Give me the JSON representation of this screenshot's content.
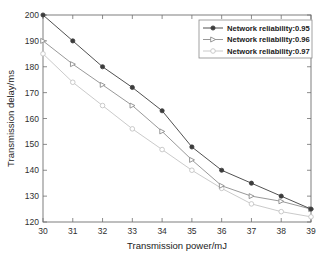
{
  "chart_data": {
    "type": "line",
    "title": "",
    "xlabel": "Transmission power/mJ",
    "ylabel": "Transmission delay/ms",
    "x": [
      30,
      31,
      32,
      33,
      34,
      35,
      36,
      37,
      38,
      39
    ],
    "xtick_labels": [
      "30",
      "31",
      "32",
      "33",
      "34",
      "35",
      "36",
      "37",
      "38",
      "39"
    ],
    "ytick_labels": [
      "120",
      "130",
      "140",
      "150",
      "160",
      "170",
      "180",
      "190",
      "200"
    ],
    "yticks": [
      120,
      130,
      140,
      150,
      160,
      170,
      180,
      190,
      200
    ],
    "xlim": [
      30,
      39
    ],
    "ylim": [
      120,
      200
    ],
    "grid": false,
    "legend_position": "upper-right",
    "series": [
      {
        "name": "Network reliability:0.95",
        "marker": "filled-circle",
        "color": "#3c3c3c",
        "values": [
          200,
          190,
          180,
          172,
          163,
          149,
          140,
          135,
          130,
          125
        ]
      },
      {
        "name": "Network reliability:0.96",
        "marker": "open-triangle-right",
        "color": "#8c8c8c",
        "values": [
          190,
          181,
          173,
          165,
          155,
          144,
          134,
          130,
          128,
          125
        ]
      },
      {
        "name": "Network reliability:0.97",
        "marker": "open-circle",
        "color": "#c4c4c4",
        "values": [
          185,
          174,
          165,
          156,
          148,
          140,
          133,
          127,
          124,
          122
        ]
      }
    ]
  },
  "legend": {
    "entries": [
      {
        "label": "Network reliability:0.95"
      },
      {
        "label": "Network reliability:0.96"
      },
      {
        "label": "Network reliability:0.97"
      }
    ]
  },
  "colors": {
    "background": "#ffffff",
    "axis": "#707070",
    "series_1": "#3c3c3c",
    "series_2": "#8c8c8c",
    "series_3": "#c4c4c4"
  }
}
